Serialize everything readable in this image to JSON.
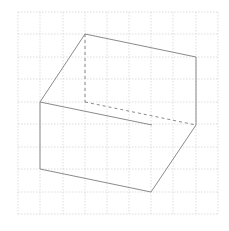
{
  "diagram": {
    "type": "isometric-sketch-on-grid",
    "colors": {
      "background": "#ffffff",
      "grid": "#d0d0d0",
      "edge": "#8a8a8a",
      "hidden_edge": "#8a8a8a"
    },
    "grid": {
      "x_lines": [
        18,
        40,
        63,
        85,
        107,
        129,
        151,
        173,
        196,
        218
      ],
      "y_lines": [
        12,
        34,
        57,
        79,
        102,
        124,
        147,
        169,
        192,
        214
      ]
    },
    "vertices": {
      "top_back_left": [
        85,
        34
      ],
      "top_back_right": [
        196,
        57
      ],
      "top_front_left": [
        40,
        102
      ],
      "hidden_corner": [
        85,
        102
      ],
      "right_mid": [
        196,
        125
      ],
      "front_top_right": [
        152,
        125
      ],
      "bottom_left": [
        40,
        169
      ],
      "bottom_right": [
        151,
        192
      ]
    },
    "solid_edges": [
      [
        85,
        34,
        196,
        57
      ],
      [
        85,
        34,
        40,
        102
      ],
      [
        196,
        57,
        196,
        125
      ],
      [
        40,
        102,
        152,
        125
      ],
      [
        40,
        102,
        40,
        169
      ],
      [
        40,
        169,
        151,
        192
      ],
      [
        151,
        192,
        196,
        125
      ]
    ],
    "hidden_edges": [
      [
        85,
        34,
        85,
        102
      ],
      [
        85,
        102,
        196,
        125
      ]
    ]
  }
}
